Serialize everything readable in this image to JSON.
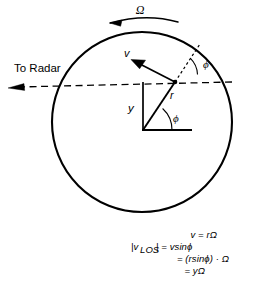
{
  "figure": {
    "background_color": "#ffffff",
    "stroke_color": "#000000"
  },
  "labels": {
    "omega_top": "Ω",
    "to_radar": "To Radar",
    "velocity": "v",
    "radius": "r",
    "height": "y",
    "angle_upper": "ϕ",
    "angle_lower": "ϕ"
  },
  "equations": {
    "line1": "v = rΩ",
    "line2_lhs": "|v",
    "line2_sub": "LOS",
    "line2_rhs": "| = vsinϕ",
    "line3": "= (rsinϕ) · Ω",
    "line4": "= yΩ",
    "all": [
      "v = rΩ",
      "|vLOS| = vsinϕ",
      "= (rsinϕ) · Ω",
      "= yΩ"
    ]
  },
  "geometry": {
    "circle": {
      "cx": 142,
      "cy": 122,
      "r": 90
    },
    "point_on_circle": {
      "x": 175,
      "y": 82
    },
    "origin": {
      "x": 143,
      "y": 130
    },
    "line_of_sight_y": 82,
    "velocity_arrow_tip": {
      "x": 131,
      "y": 60
    },
    "radar_arrow_tip": {
      "x": 8,
      "y": 88
    }
  }
}
